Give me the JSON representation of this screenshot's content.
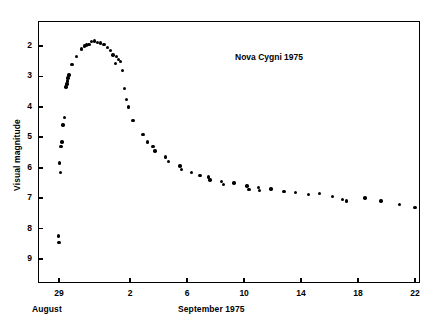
{
  "figure": {
    "annotation": "Nova Cygni 1975",
    "y_axis_title": "Visual magnitude",
    "x_axis_title": "September 1975",
    "x_axis_title_prev": "August"
  },
  "chart_data": {
    "type": "scatter",
    "title": "Nova Cygni 1975",
    "xlabel": "September 1975",
    "ylabel": "Visual magnitude",
    "xlim": [
      27.6,
      23.4
    ],
    "ylim": [
      1.4,
      9.7
    ],
    "y_inverted": true,
    "grid": false,
    "legend": "none",
    "xtick_labels": [
      "29",
      "2",
      "6",
      "10",
      "14",
      "18",
      "22"
    ],
    "xtick_values": [
      -3,
      2,
      6,
      10,
      14,
      18,
      22
    ],
    "ytick_labels": [
      "2",
      "3",
      "4",
      "5",
      "6",
      "7",
      "8",
      "9"
    ],
    "ytick_values": [
      2,
      3,
      4,
      5,
      6,
      7,
      8,
      9
    ],
    "x_note": "x values are days of September 1975; negative values are August days (-3 = August 29)",
    "series": [
      {
        "name": "Visual magnitude estimates",
        "marker": "filled-circle",
        "color": "#000000",
        "points": [
          [
            -3.05,
            8.25
          ],
          [
            -3.0,
            8.45
          ],
          [
            -2.95,
            5.85
          ],
          [
            -2.9,
            6.15
          ],
          [
            -2.85,
            5.3
          ],
          [
            -2.8,
            5.15
          ],
          [
            -2.72,
            4.6
          ],
          [
            -2.62,
            4.35
          ],
          [
            -2.5,
            3.35
          ],
          [
            -2.45,
            3.25
          ],
          [
            -2.42,
            3.15
          ],
          [
            -2.38,
            3.05
          ],
          [
            -2.3,
            2.95
          ],
          [
            -2.1,
            2.6
          ],
          [
            -1.75,
            2.35
          ],
          [
            -1.4,
            2.1
          ],
          [
            -1.2,
            2.0
          ],
          [
            -1.05,
            1.97
          ],
          [
            -0.9,
            1.95
          ],
          [
            -0.7,
            1.85
          ],
          [
            -0.5,
            1.83
          ],
          [
            -0.3,
            1.88
          ],
          [
            -0.1,
            1.9
          ],
          [
            0.15,
            1.95
          ],
          [
            0.4,
            2.05
          ],
          [
            0.6,
            2.15
          ],
          [
            0.78,
            2.3
          ],
          [
            0.95,
            2.58
          ],
          [
            1.05,
            2.35
          ],
          [
            1.2,
            2.45
          ],
          [
            1.3,
            2.5
          ],
          [
            1.45,
            2.8
          ],
          [
            1.6,
            3.4
          ],
          [
            1.75,
            3.75
          ],
          [
            1.9,
            4.0
          ],
          [
            2.2,
            4.45
          ],
          [
            2.9,
            4.9
          ],
          [
            3.2,
            5.15
          ],
          [
            3.6,
            5.3
          ],
          [
            3.75,
            5.45
          ],
          [
            4.5,
            5.65
          ],
          [
            4.7,
            5.8
          ],
          [
            5.5,
            5.95
          ],
          [
            5.62,
            6.05
          ],
          [
            6.3,
            6.15
          ],
          [
            6.9,
            6.25
          ],
          [
            7.5,
            6.3
          ],
          [
            7.6,
            6.4
          ],
          [
            8.4,
            6.45
          ],
          [
            8.55,
            6.55
          ],
          [
            9.3,
            6.5
          ],
          [
            10.2,
            6.6
          ],
          [
            10.35,
            6.72
          ],
          [
            11.0,
            6.65
          ],
          [
            11.1,
            6.75
          ],
          [
            11.9,
            6.7
          ],
          [
            12.8,
            6.78
          ],
          [
            13.6,
            6.82
          ],
          [
            14.5,
            6.88
          ],
          [
            15.3,
            6.85
          ],
          [
            16.2,
            6.95
          ],
          [
            16.9,
            7.05
          ],
          [
            17.2,
            7.1
          ],
          [
            18.5,
            7.0
          ],
          [
            19.6,
            7.1
          ],
          [
            20.9,
            7.2
          ],
          [
            22.0,
            7.3
          ]
        ]
      }
    ]
  },
  "ticks": {
    "x": [
      {
        "label": "29",
        "value": -3
      },
      {
        "label": "2",
        "value": 2
      },
      {
        "label": "6",
        "value": 6
      },
      {
        "label": "10",
        "value": 10
      },
      {
        "label": "14",
        "value": 14
      },
      {
        "label": "18",
        "value": 18
      },
      {
        "label": "22",
        "value": 22
      }
    ],
    "y": [
      {
        "label": "2",
        "value": 2
      },
      {
        "label": "3",
        "value": 3
      },
      {
        "label": "4",
        "value": 4
      },
      {
        "label": "5",
        "value": 5
      },
      {
        "label": "6",
        "value": 6
      },
      {
        "label": "7",
        "value": 7
      },
      {
        "label": "8",
        "value": 8
      },
      {
        "label": "9",
        "value": 9
      }
    ]
  }
}
